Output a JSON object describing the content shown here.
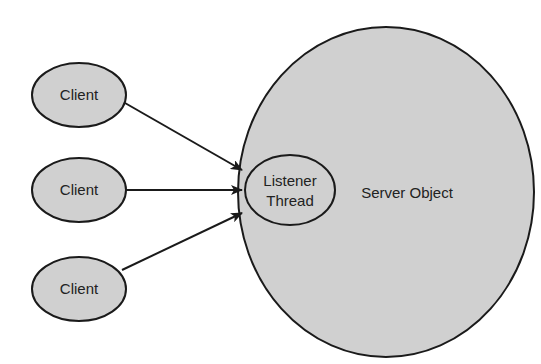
{
  "diagram": {
    "nodes": {
      "clients": [
        {
          "label": "Client"
        },
        {
          "label": "Client"
        },
        {
          "label": "Client"
        }
      ],
      "server": {
        "label": "Server Object"
      },
      "listener": {
        "line1": "Listener",
        "line2": "Thread"
      }
    },
    "edges": [
      {
        "from": "Client 1",
        "to": "Listener Thread"
      },
      {
        "from": "Client 2",
        "to": "Listener Thread"
      },
      {
        "from": "Client 3",
        "to": "Listener Thread"
      }
    ],
    "colors": {
      "fill": "#d0d0d0",
      "stroke": "#1a1a1a",
      "background": "#ffffff"
    }
  }
}
